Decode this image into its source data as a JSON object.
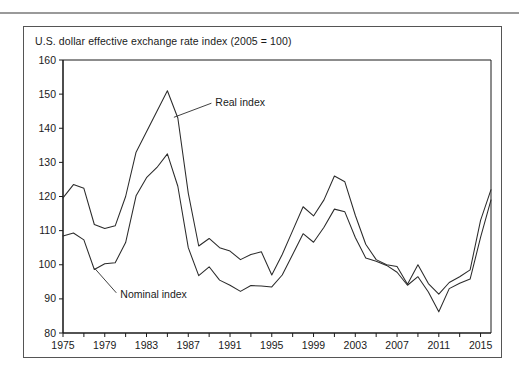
{
  "figure": {
    "title": "U.S. dollar effective exchange rate index (2005 = 100)"
  },
  "chart_data": {
    "type": "line",
    "title": "U.S. dollar effective exchange rate index (2005 = 100)",
    "xlabel": "",
    "ylabel": "",
    "xlim": [
      1975,
      2016
    ],
    "ylim": [
      80,
      160
    ],
    "grid": false,
    "legend": "annotations",
    "y_ticks": [
      80,
      90,
      100,
      110,
      120,
      130,
      140,
      150,
      160
    ],
    "x_ticks": [
      1975,
      1977,
      1979,
      1981,
      1983,
      1985,
      1987,
      1989,
      1991,
      1993,
      1995,
      1997,
      1999,
      2001,
      2003,
      2005,
      2007,
      2009,
      2011,
      2013,
      2015
    ],
    "x_tick_labels": [
      "1975",
      "",
      "1979",
      "",
      "1983",
      "",
      "1987",
      "",
      "1991",
      "",
      "1995",
      "",
      "1999",
      "",
      "2003",
      "",
      "2007",
      "",
      "2011",
      "",
      "2015"
    ],
    "x": [
      1975,
      1976,
      1977,
      1978,
      1979,
      1980,
      1981,
      1982,
      1983,
      1984,
      1985,
      1986,
      1987,
      1988,
      1989,
      1990,
      1991,
      1992,
      1993,
      1994,
      1995,
      1996,
      1997,
      1998,
      1999,
      2000,
      2001,
      2002,
      2003,
      2004,
      2005,
      2006,
      2007,
      2008,
      2009,
      2010,
      2011,
      2012,
      2013,
      2014,
      2015,
      2016
    ],
    "series": [
      {
        "name": "Real index",
        "annotation": "Real index",
        "values": [
          119.6,
          123.5,
          122.4,
          111.8,
          110.6,
          111.4,
          120.0,
          133.0,
          139.0,
          145.0,
          151.0,
          143.0,
          121.0,
          105.5,
          107.7,
          105.0,
          104.0,
          101.5,
          103.0,
          103.8,
          97.0,
          103.0,
          110.0,
          117.0,
          114.3,
          119.0,
          126.0,
          124.3,
          114.5,
          106.0,
          101.5,
          100.0,
          99.5,
          94.3,
          100.0,
          94.5,
          91.4,
          94.8,
          96.5,
          98.5,
          113.0,
          122.0
        ]
      },
      {
        "name": "Nominal index",
        "annotation": "Nominal index",
        "values": [
          108.4,
          109.3,
          107.3,
          98.6,
          100.3,
          100.6,
          106.5,
          120.2,
          125.5,
          128.5,
          132.5,
          123.0,
          105.0,
          96.8,
          99.4,
          95.5,
          94.0,
          92.2,
          93.9,
          93.8,
          93.5,
          97.0,
          103.0,
          109.1,
          106.6,
          111.0,
          116.3,
          115.5,
          108.0,
          102.0,
          101.0,
          99.8,
          97.8,
          94.0,
          96.5,
          92.0,
          86.2,
          93.0,
          94.6,
          95.8,
          108.0,
          119.0
        ]
      }
    ],
    "annotations": [
      {
        "text": "Real index",
        "x": 1989.5,
        "y": 147.5
      },
      {
        "text": "Nominal index",
        "x": 1980.3,
        "y": 91.5
      }
    ]
  }
}
